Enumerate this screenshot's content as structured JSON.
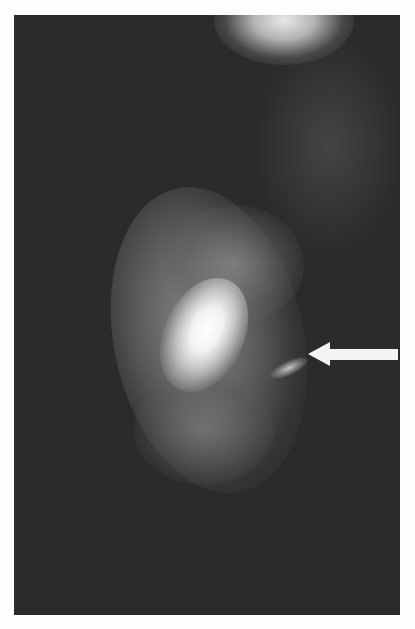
{
  "image": {
    "type": "radiograph",
    "description": "Grayscale X-ray image of soft tissue with a bright dense central region and a white arrow pointing left at a small bright lesion",
    "background_color": "#2b2b2b",
    "page_color": "#fdfdfd"
  },
  "annotations": [
    {
      "kind": "arrow",
      "direction": "left",
      "color": "#f4f4f4",
      "target": "small-bright-lesion"
    }
  ]
}
